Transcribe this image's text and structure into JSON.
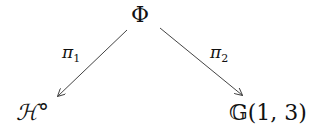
{
  "diagram": {
    "top_node": "Φ",
    "left_node": "ℋ°",
    "right_node": "𝔾(1, 3)",
    "left_arrow": {
      "symbol": "π",
      "subscript": "1"
    },
    "right_arrow": {
      "symbol": "π",
      "subscript": "2"
    },
    "colors": {
      "text": "#111111",
      "arrow": "#444444",
      "background": "#ffffff"
    }
  }
}
